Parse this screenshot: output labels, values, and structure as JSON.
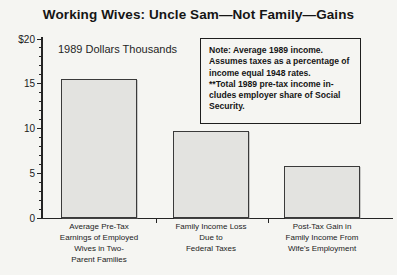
{
  "title": "Working Wives: Uncle Sam—Not Family—Gains",
  "units_annotation": "1989 Dollars Thousands",
  "note_box": {
    "lines": [
      "Note: Average 1989 income.",
      "Assumes taxes as a percentage of",
      "income equal 1948 rates.",
      "**Total 1989 pre-tax income in-",
      "cludes employer share of Social",
      "Security."
    ]
  },
  "chart_data": {
    "type": "bar",
    "title": "Working Wives: Uncle Sam—Not Family—Gains",
    "subtitle": "1989 Dollars Thousands",
    "categories": [
      "Average Pre-Tax\nEarnings of Employed\nWives in Two-\nParent Families",
      "Family Income Loss\nDue to\nFederal Taxes",
      "Post-Tax Gain in\nFamily Income From\nWife's Employment"
    ],
    "values": [
      15.5,
      9.7,
      5.8
    ],
    "xlabel": "",
    "ylabel": "1989 Dollars Thousands",
    "ylim": [
      0,
      20
    ],
    "ytick_values": [
      0,
      5,
      10,
      15,
      20
    ],
    "ytick_labels": [
      "0",
      "5",
      "10",
      "15",
      "$20"
    ],
    "minor_tick_step": 1,
    "grid": false,
    "legend": null,
    "note": "Note: Average 1989 income. Assumes taxes as a percentage of income equal 1948 rates. **Total 1989 pre-tax income includes employer share of Social Security.",
    "bar_fill": "#e3e3e0",
    "bar_border": "#3a3a3a",
    "background": "#f5f5f2",
    "text_color": "#1a1a1a"
  }
}
